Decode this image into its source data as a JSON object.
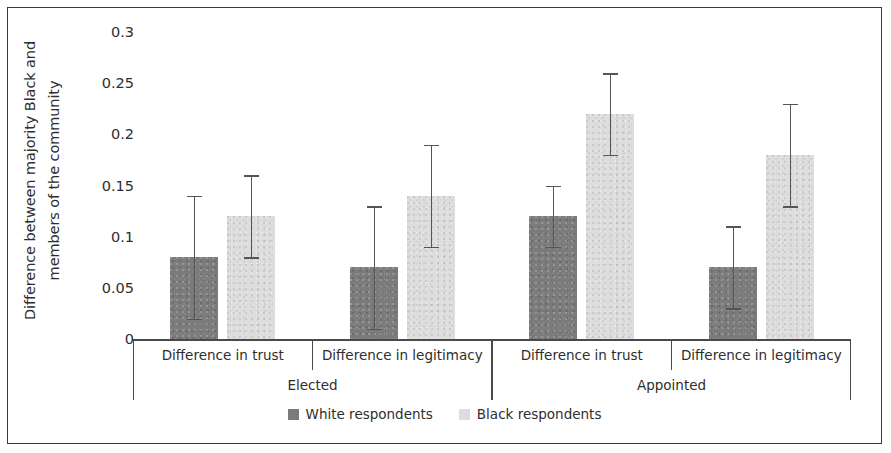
{
  "chart_data": {
    "type": "bar",
    "title": "",
    "xlabel": "",
    "ylabel": "Difference between majority Black and members of the community",
    "ylabel_line1": "Difference between majority Black and",
    "ylabel_line2": "members of the community",
    "ylim": [
      0,
      0.3
    ],
    "ytick_labels": [
      "0.3",
      "0.25",
      "0.2",
      "0.15",
      "0.1",
      "0.05",
      "0"
    ],
    "ytick_values": [
      0.3,
      0.25,
      0.2,
      0.15,
      0.1,
      0.05,
      0
    ],
    "grid": false,
    "legend_position": "bottom",
    "group_labels": [
      "Elected",
      "Appointed"
    ],
    "categories": [
      "Difference in trust",
      "Difference in legitimacy",
      "Difference in trust",
      "Difference in legitimacy"
    ],
    "series": [
      {
        "name": "White respondents",
        "color": "#7b7b7b",
        "values": [
          0.08,
          0.07,
          0.12,
          0.07
        ],
        "ci_low": [
          0.02,
          0.01,
          0.09,
          0.03
        ],
        "ci_high": [
          0.14,
          0.13,
          0.15,
          0.11
        ]
      },
      {
        "name": "Black respondents",
        "color": "#dddddd",
        "values": [
          0.12,
          0.14,
          0.22,
          0.18
        ],
        "ci_low": [
          0.08,
          0.09,
          0.18,
          0.13
        ],
        "ci_high": [
          0.16,
          0.19,
          0.26,
          0.23
        ]
      }
    ]
  },
  "legend": {
    "items": [
      {
        "label": "White respondents",
        "swatch": "white-r"
      },
      {
        "label": "Black respondents",
        "swatch": "black-r"
      }
    ]
  }
}
